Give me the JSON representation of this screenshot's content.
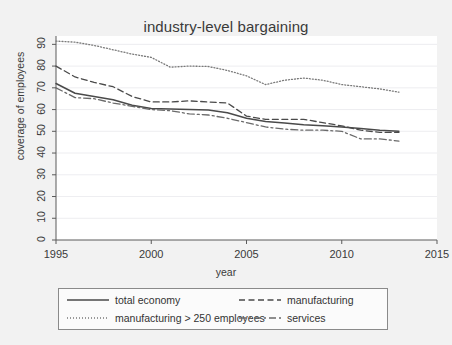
{
  "chart_data": {
    "type": "line",
    "title": "industry-level bargaining",
    "xlabel": "year",
    "ylabel": "coverage of employees",
    "xlim": [
      1995,
      2015
    ],
    "ylim": [
      0,
      92
    ],
    "xticks": [
      1995,
      2000,
      2005,
      2010,
      2015
    ],
    "yticks": [
      0,
      10,
      20,
      30,
      40,
      50,
      60,
      70,
      80,
      90
    ],
    "grid": true,
    "legend_position": "below-plot",
    "x": [
      1995,
      1996,
      1997,
      1998,
      1999,
      2000,
      2001,
      2002,
      2003,
      2004,
      2005,
      2006,
      2007,
      2008,
      2009,
      2010,
      2011,
      2012,
      2013
    ],
    "series": [
      {
        "name": "total economy",
        "style": "solid",
        "color": "#4a4a4a",
        "values": [
          72.0,
          67.5,
          66.0,
          64.5,
          62.0,
          60.5,
          60.3,
          60.0,
          59.8,
          58.5,
          56.0,
          54.5,
          53.8,
          53.0,
          52.5,
          52.0,
          51.3,
          50.5,
          50.0
        ]
      },
      {
        "name": "manufacturing > 250 employees",
        "style": "dotted",
        "color": "#7a7a7a",
        "values": [
          91.5,
          91.0,
          89.5,
          87.5,
          85.5,
          84.0,
          79.5,
          80.0,
          79.8,
          78.0,
          75.5,
          71.5,
          73.5,
          74.5,
          73.5,
          71.5,
          70.5,
          69.5,
          68.0
        ]
      },
      {
        "name": "manufacturing",
        "style": "dashed",
        "color": "#4a4a4a",
        "values": [
          80.0,
          75.0,
          72.5,
          70.5,
          66.0,
          63.5,
          63.5,
          64.0,
          63.5,
          63.0,
          57.0,
          55.5,
          55.5,
          55.5,
          54.0,
          52.5,
          50.5,
          49.5,
          49.5
        ]
      },
      {
        "name": "services",
        "style": "dashdot",
        "color": "#6a6a6a",
        "values": [
          70.0,
          65.5,
          65.0,
          63.0,
          61.5,
          60.0,
          59.5,
          58.0,
          57.5,
          56.0,
          54.0,
          52.0,
          51.0,
          50.5,
          50.5,
          50.0,
          46.5,
          46.5,
          45.5
        ]
      }
    ]
  },
  "legend": {
    "entries": [
      {
        "label": "total economy",
        "style": "solid"
      },
      {
        "label": "manufacturing",
        "style": "dashed"
      },
      {
        "label": "manufacturing > 250 employees",
        "style": "dotted"
      },
      {
        "label": "services",
        "style": "dashdot"
      }
    ]
  }
}
